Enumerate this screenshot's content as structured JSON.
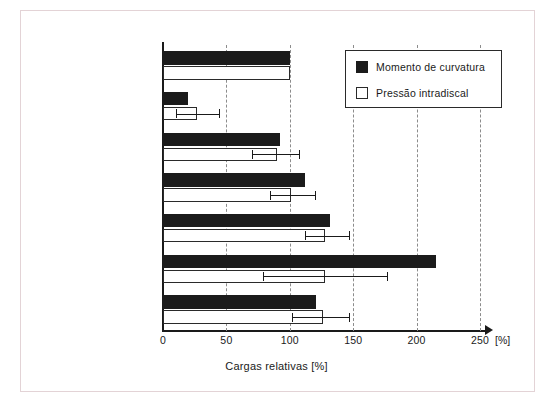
{
  "figure": {
    "axis_title": "Cargas relativas [%]",
    "unit_marker": "[%]"
  },
  "legend": {
    "items": [
      {
        "key": "dark",
        "label": "Momento de curvatura",
        "color": "#1b1b1b"
      },
      {
        "key": "light",
        "label": "Pressão intradiscal",
        "color": "#ffffff"
      }
    ]
  },
  "chart_data": {
    "type": "bar",
    "orientation": "horizontal",
    "title": "",
    "xlabel": "Cargas relativas [%]",
    "ylabel": "",
    "xlim": [
      0,
      265
    ],
    "xticks": [
      0,
      50,
      100,
      150,
      200,
      250
    ],
    "xtick_labels": [
      "0",
      "50",
      "100",
      "150",
      "200",
      "250"
    ],
    "grid": "vertical dashed at each xtick",
    "legend_position": "top-right inside axes",
    "categories": [
      "Em pé",
      "Decúbito dorsal",
      "Sentado confortavelmente",
      "Sentado com as costas retas",
      "Andando",
      "Flexão da parte\nsuperior do tronco",
      "Extensão"
    ],
    "series": [
      {
        "name": "Momento de curvatura",
        "color": "#1b1b1b",
        "values": [
          100,
          20,
          92,
          112,
          132,
          215,
          121
        ],
        "errors": [
          null,
          null,
          null,
          null,
          null,
          null,
          null
        ]
      },
      {
        "name": "Pressão intradiscal",
        "color": "#ffffff",
        "values": [
          100,
          27,
          90,
          101,
          128,
          128,
          126
        ],
        "errors": [
          null,
          {
            "low": 10,
            "high": 44
          },
          {
            "low": 70,
            "high": 107
          },
          {
            "low": 84,
            "high": 120
          },
          {
            "low": 112,
            "high": 147
          },
          {
            "low": 79,
            "high": 177
          },
          {
            "low": 102,
            "high": 147
          }
        ]
      }
    ]
  }
}
